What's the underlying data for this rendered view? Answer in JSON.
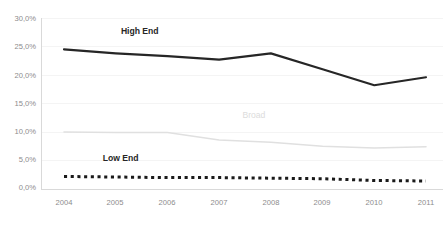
{
  "chart_data": {
    "type": "line",
    "title": "",
    "subtitle": "",
    "xlabel": "",
    "ylabel": "",
    "categories": [
      "2004",
      "2005",
      "2006",
      "2007",
      "2008",
      "2009",
      "2010",
      "2011"
    ],
    "x": [
      2004,
      2005,
      2006,
      2007,
      2008,
      2009,
      2010,
      2011
    ],
    "ylim": [
      0.0,
      30.0
    ],
    "ytick_values": [
      0.0,
      5.0,
      10.0,
      15.0,
      20.0,
      25.0,
      30.0
    ],
    "ytick_labels": [
      "0,0%",
      "5,0%",
      "10,0%",
      "15,0%",
      "20,0%",
      "25,0%",
      "30,0%"
    ],
    "grid": false,
    "legend": "inline-labels",
    "value_unit": "percent",
    "decimal_separator": ",",
    "series": [
      {
        "name": "High End",
        "values": [
          24.5,
          23.8,
          23.3,
          22.7,
          23.8,
          21.0,
          18.2,
          19.6
        ],
        "color": "#262626",
        "style": "solid",
        "width": 2.2,
        "label_text": "High End",
        "label_x": 2005.1,
        "label_y": 27.2
      },
      {
        "name": "Broad",
        "values": [
          10.0,
          9.9,
          9.9,
          8.6,
          8.2,
          7.5,
          7.2,
          7.4
        ],
        "color": "#e0e0e0",
        "style": "solid",
        "width": 1.6,
        "label_text": "Broad",
        "label_x": 2007.45,
        "label_y": 12.5
      },
      {
        "name": "Low End",
        "values": [
          2.2,
          2.1,
          2.0,
          2.0,
          1.9,
          1.8,
          1.5,
          1.4
        ],
        "color": "#1a1a1a",
        "style": "dotted",
        "width": 3.0,
        "label_text": "Low End",
        "label_x": 2004.75,
        "label_y": 5.0
      }
    ]
  },
  "axis": {
    "ytick_0": "0,0%",
    "ytick_1": "5,0%",
    "ytick_2": "10,0%",
    "ytick_3": "15,0%",
    "ytick_4": "20,0%",
    "ytick_5": "25,0%",
    "ytick_6": "30,0%",
    "xtick_0": "2004",
    "xtick_1": "2005",
    "xtick_2": "2006",
    "xtick_3": "2007",
    "xtick_4": "2008",
    "xtick_5": "2009",
    "xtick_6": "2010",
    "xtick_7": "2011"
  },
  "labels": {
    "high_end": "High End",
    "broad": "Broad",
    "low_end": "Low End"
  }
}
